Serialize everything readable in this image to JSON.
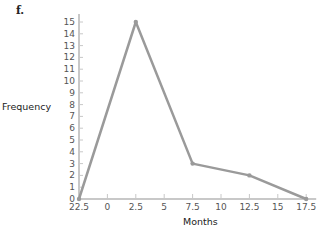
{
  "panel_label": "f.",
  "chart_data": {
    "type": "line",
    "title": "",
    "xlabel": "Months",
    "ylabel": "Frequency",
    "x_tick_labels": [
      "22.5",
      "0",
      "2.5",
      "5",
      "7.5",
      "10",
      "12.5",
      "15",
      "17.5"
    ],
    "y_tick_labels": [
      "0",
      "1",
      "2",
      "3",
      "4",
      "5",
      "6",
      "7",
      "8",
      "9",
      "10",
      "11",
      "12",
      "13",
      "14",
      "15"
    ],
    "ylim": [
      0,
      15
    ],
    "grid": false,
    "series": [
      {
        "name": "Frequency polygon",
        "color": "#9a9a9a",
        "points": [
          {
            "x": "22.5",
            "y": 0
          },
          {
            "x": "2.5",
            "y": 15
          },
          {
            "x": "7.5",
            "y": 3
          },
          {
            "x": "12.5",
            "y": 2
          },
          {
            "x": "17.5",
            "y": 0
          }
        ]
      }
    ]
  }
}
